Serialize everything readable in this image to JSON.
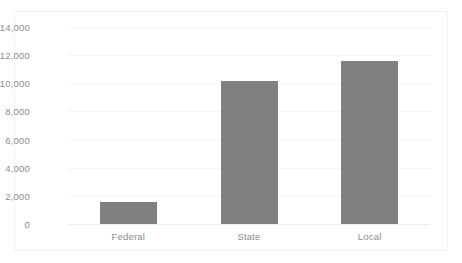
{
  "chart_data": {
    "type": "bar",
    "title": "",
    "subtitle": "",
    "xlabel": "",
    "ylabel": "",
    "categories": [
      "Federal",
      "State",
      "Local"
    ],
    "values": [
      1570,
      10150,
      11600
    ],
    "series": [
      {
        "name": "",
        "values": [
          1570,
          10150,
          11600
        ],
        "color": "#808080"
      }
    ],
    "ylim": [
      0,
      14000
    ],
    "ytick_labels": [
      "0",
      "2,000",
      "4,000",
      "6,000",
      "8,000",
      "10,000",
      "12,000",
      "14,000"
    ],
    "ytick_values": [
      0,
      2000,
      4000,
      6000,
      8000,
      10000,
      12000,
      14000
    ],
    "grid": true,
    "grid_axis": "y",
    "legend": false,
    "legend_position": "none",
    "bar_color": "#808080",
    "gridline_color": "#f4f4f4",
    "axis_text_color": "#8c8c8c",
    "plot_background": "#ffffff",
    "frame_border_color": "#f2f2f2"
  }
}
